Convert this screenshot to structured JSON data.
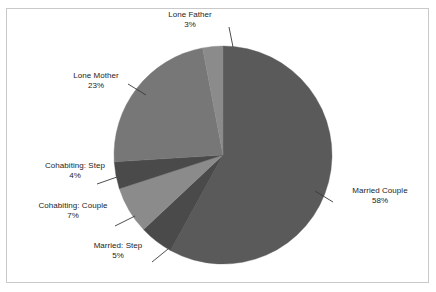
{
  "chart_data": {
    "type": "pie",
    "title": "",
    "xlabel": "",
    "ylabel": "",
    "legend_position": "none",
    "grid": false,
    "start_angle_deg": 0,
    "direction": "clockwise",
    "categories": [
      "Married Couple",
      "Married: Step",
      "Cohabiting: Couple",
      "Cohabiting: Step",
      "Lone Mother",
      "Lone Father"
    ],
    "values": [
      58,
      5,
      7,
      4,
      23,
      3
    ],
    "value_unit": "%",
    "slices": [
      {
        "label": "Married Couple",
        "value": 58,
        "value_text": "58%",
        "color": "#5a5a5a",
        "start_deg": 0,
        "end_deg": 208.8
      },
      {
        "label": "Married: Step",
        "value": 5,
        "value_text": "5%",
        "color": "#4a4a4a",
        "start_deg": 208.8,
        "end_deg": 226.8
      },
      {
        "label": "Cohabiting: Couple",
        "value": 7,
        "value_text": "7%",
        "color": "#8b8b8b",
        "start_deg": 226.8,
        "end_deg": 252.0
      },
      {
        "label": "Cohabiting: Step",
        "value": 4,
        "value_text": "4%",
        "color": "#4a4a4a",
        "start_deg": 252.0,
        "end_deg": 266.4
      },
      {
        "label": "Lone Mother",
        "value": 23,
        "value_text": "23%",
        "color": "#777777",
        "start_deg": 266.4,
        "end_deg": 349.2
      },
      {
        "label": "Lone Father",
        "value": 3,
        "value_text": "3%",
        "color": "#8b8b8b",
        "start_deg": 349.2,
        "end_deg": 360.0
      }
    ],
    "total": 100,
    "geometry": {
      "center_x": 223,
      "center_y": 155,
      "radius": 109
    }
  },
  "colors": {
    "background": "#ffffff",
    "frame": "#c9c9c9",
    "text": "#1d1d1d",
    "leader_line": "#3a3a3a"
  },
  "labels": {
    "lone_father": {
      "name": "Lone Father",
      "value": "3%"
    },
    "lone_mother": {
      "name": "Lone Mother",
      "value": "23%"
    },
    "cohab_step": {
      "name": "Cohabiting: Step",
      "value": "4%"
    },
    "cohab_couple": {
      "name": "Cohabiting: Couple",
      "value": "7%"
    },
    "married_step": {
      "name": "Married: Step",
      "value": "5%"
    },
    "married_couple": {
      "name": "Married Couple",
      "value": "58%"
    }
  }
}
